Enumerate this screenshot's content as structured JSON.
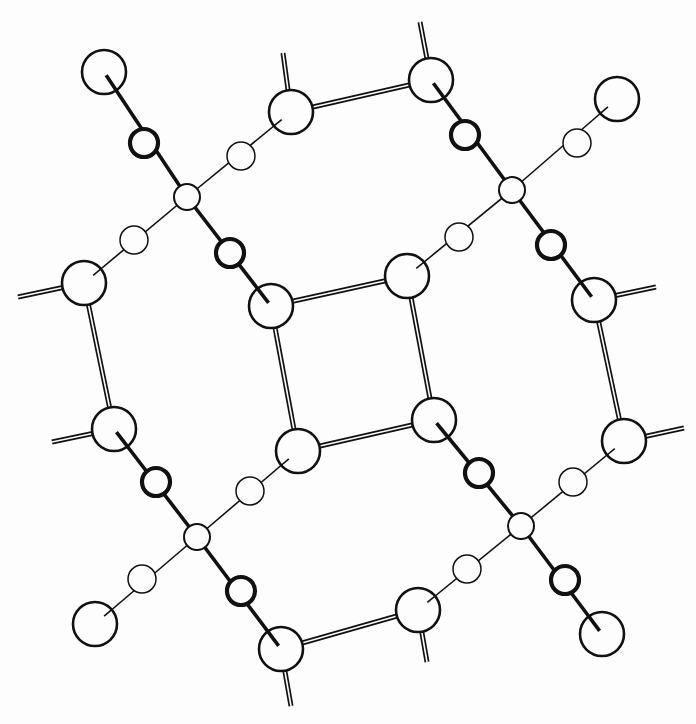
{
  "diagram": {
    "title": "",
    "colors": {
      "ink": "#111111",
      "background": "#fdfdfd"
    },
    "atoms": {
      "large": [
        {
          "id": "L1",
          "x": 104,
          "y": 72
        },
        {
          "id": "L2",
          "x": 291,
          "y": 112
        },
        {
          "id": "L3",
          "x": 431,
          "y": 80
        },
        {
          "id": "L4",
          "x": 617,
          "y": 99
        },
        {
          "id": "L5",
          "x": 84,
          "y": 283
        },
        {
          "id": "L6",
          "x": 271,
          "y": 306
        },
        {
          "id": "L7",
          "x": 407,
          "y": 276
        },
        {
          "id": "L8",
          "x": 594,
          "y": 300
        },
        {
          "id": "L9",
          "x": 114,
          "y": 429
        },
        {
          "id": "L10",
          "x": 298,
          "y": 451
        },
        {
          "id": "L11",
          "x": 434,
          "y": 420
        },
        {
          "id": "L12",
          "x": 624,
          "y": 441
        },
        {
          "id": "L13",
          "x": 95,
          "y": 624
        },
        {
          "id": "L14",
          "x": 281,
          "y": 649
        },
        {
          "id": "L15",
          "x": 418,
          "y": 610
        },
        {
          "id": "L16",
          "x": 602,
          "y": 634
        }
      ],
      "medium": [
        {
          "id": "M1",
          "x": 144,
          "y": 143
        },
        {
          "id": "M2",
          "x": 230,
          "y": 253
        },
        {
          "id": "M3",
          "x": 465,
          "y": 135
        },
        {
          "id": "M4",
          "x": 551,
          "y": 245
        },
        {
          "id": "M5",
          "x": 156,
          "y": 482
        },
        {
          "id": "M6",
          "x": 241,
          "y": 591
        },
        {
          "id": "M7",
          "x": 479,
          "y": 473
        },
        {
          "id": "M8",
          "x": 565,
          "y": 580
        }
      ],
      "small": [
        {
          "id": "S1",
          "x": 241,
          "y": 156
        },
        {
          "id": "S2",
          "x": 134,
          "y": 240
        },
        {
          "id": "S3",
          "x": 577,
          "y": 143
        },
        {
          "id": "S4",
          "x": 459,
          "y": 237
        },
        {
          "id": "S5",
          "x": 250,
          "y": 491
        },
        {
          "id": "S6",
          "x": 142,
          "y": 579
        },
        {
          "id": "S7",
          "x": 573,
          "y": 482
        },
        {
          "id": "S8",
          "x": 467,
          "y": 569
        }
      ],
      "centers": [
        {
          "id": "C1",
          "x": 187,
          "y": 197
        },
        {
          "id": "C2",
          "x": 512,
          "y": 190
        },
        {
          "id": "C3",
          "x": 197,
          "y": 537
        },
        {
          "id": "C4",
          "x": 521,
          "y": 526
        }
      ]
    },
    "thick_bonds": [
      [
        "L1",
        "C1"
      ],
      [
        "C1",
        "L6"
      ],
      [
        "L3",
        "C2"
      ],
      [
        "C2",
        "L8"
      ],
      [
        "L9",
        "C3"
      ],
      [
        "C3",
        "L14"
      ],
      [
        "L11",
        "C4"
      ],
      [
        "C4",
        "L16"
      ]
    ],
    "thin_bonds": [
      [
        "L5",
        "C1"
      ],
      [
        "C1",
        "L2"
      ],
      [
        "L7",
        "C2"
      ],
      [
        "C2",
        "L4"
      ],
      [
        "L13",
        "C3"
      ],
      [
        "C3",
        "L10"
      ],
      [
        "L15",
        "C4"
      ],
      [
        "C4",
        "L12"
      ]
    ],
    "double_bonds": [
      [
        "L2",
        "L3"
      ],
      [
        "L6",
        "L7"
      ],
      [
        "L7",
        "L11"
      ],
      [
        "L11",
        "L10"
      ],
      [
        "L10",
        "L6"
      ],
      [
        "L5",
        "L9"
      ],
      [
        "L8",
        "L12"
      ],
      [
        "L14",
        "L15"
      ]
    ],
    "double_stubs": [
      {
        "from": "L2",
        "x2": 283,
        "y2": 53
      },
      {
        "from": "L3",
        "x2": 420,
        "y2": 22
      },
      {
        "from": "L5",
        "x2": 18,
        "y2": 297
      },
      {
        "from": "L9",
        "x2": 52,
        "y2": 442
      },
      {
        "from": "L8",
        "x2": 656,
        "y2": 287
      },
      {
        "from": "L12",
        "x2": 684,
        "y2": 428
      },
      {
        "from": "L14",
        "x2": 291,
        "y2": 706
      },
      {
        "from": "L15",
        "x2": 427,
        "y2": 662
      }
    ]
  }
}
